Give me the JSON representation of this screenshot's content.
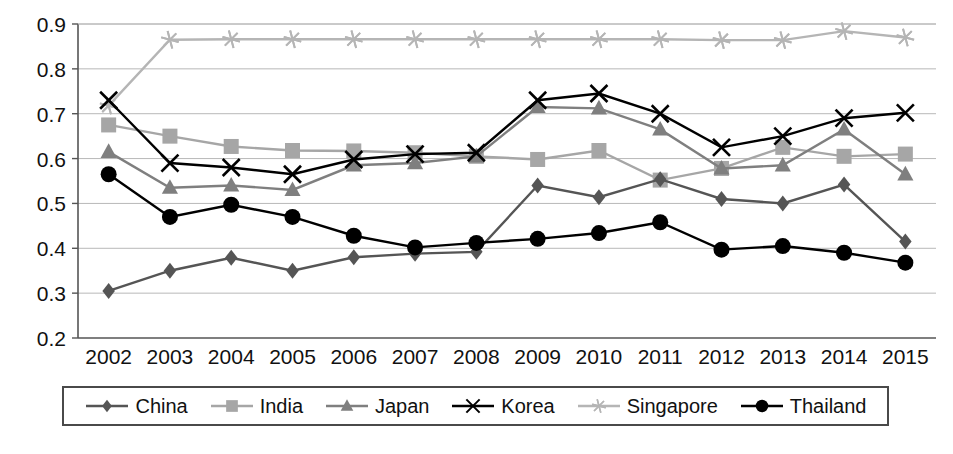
{
  "chart_data": {
    "type": "line",
    "title": "",
    "xlabel": "",
    "ylabel": "",
    "x": [
      2002,
      2003,
      2004,
      2005,
      2006,
      2007,
      2008,
      2009,
      2010,
      2011,
      2012,
      2013,
      2014,
      2015
    ],
    "categories": [
      "2002",
      "2003",
      "2004",
      "2005",
      "2006",
      "2007",
      "2008",
      "2009",
      "2010",
      "2011",
      "2012",
      "2013",
      "2014",
      "2015"
    ],
    "ylim": [
      0.2,
      0.9
    ],
    "yticks": [
      0.2,
      0.3,
      0.4,
      0.5,
      0.6,
      0.7,
      0.8,
      0.9
    ],
    "ytick_labels": [
      "0.2",
      "0.3",
      "0.4",
      "0.5",
      "0.6",
      "0.7",
      "0.8",
      "0.9"
    ],
    "grid": true,
    "legend_position": "bottom",
    "series": [
      {
        "name": "China",
        "marker": "diamond",
        "color": "#555555",
        "values": [
          0.305,
          0.35,
          0.379,
          0.35,
          0.38,
          0.388,
          0.392,
          0.54,
          0.514,
          0.554,
          0.51,
          0.5,
          0.542,
          0.415
        ]
      },
      {
        "name": "India",
        "marker": "square",
        "color": "#a6a6a6",
        "values": [
          0.675,
          0.65,
          0.627,
          0.618,
          0.617,
          0.613,
          0.605,
          0.598,
          0.618,
          0.552,
          0.578,
          0.625,
          0.605,
          0.61
        ]
      },
      {
        "name": "Japan",
        "marker": "triangle",
        "color": "#7f7f7f",
        "values": [
          0.615,
          0.535,
          0.54,
          0.53,
          0.585,
          0.59,
          0.605,
          0.715,
          0.712,
          0.665,
          0.578,
          0.585,
          0.665,
          0.565
        ]
      },
      {
        "name": "Korea",
        "marker": "x",
        "color": "#000000",
        "values": [
          0.73,
          0.59,
          0.58,
          0.565,
          0.598,
          0.61,
          0.613,
          0.73,
          0.745,
          0.7,
          0.625,
          0.65,
          0.69,
          0.702
        ]
      },
      {
        "name": "Singapore",
        "marker": "asterisk",
        "color": "#b5b5b5",
        "values": [
          0.718,
          0.865,
          0.866,
          0.866,
          0.866,
          0.866,
          0.866,
          0.866,
          0.866,
          0.866,
          0.864,
          0.864,
          0.884,
          0.87
        ]
      },
      {
        "name": "Thailand",
        "marker": "circle",
        "color": "#000000",
        "values": [
          0.565,
          0.47,
          0.497,
          0.47,
          0.428,
          0.402,
          0.412,
          0.421,
          0.434,
          0.458,
          0.397,
          0.405,
          0.39,
          0.368
        ]
      }
    ]
  },
  "legend": {
    "items": [
      {
        "label": "China",
        "marker": "diamond",
        "color": "#555555"
      },
      {
        "label": "India",
        "marker": "square",
        "color": "#a6a6a6"
      },
      {
        "label": "Japan",
        "marker": "triangle",
        "color": "#7f7f7f"
      },
      {
        "label": "Korea",
        "marker": "x",
        "color": "#000000"
      },
      {
        "label": "Singapore",
        "marker": "asterisk",
        "color": "#b5b5b5"
      },
      {
        "label": "Thailand",
        "marker": "circle",
        "color": "#000000"
      }
    ]
  },
  "colors": {
    "axis": "#555555",
    "grid": "#b8b8b8",
    "text": "#111111",
    "background": "#ffffff"
  }
}
